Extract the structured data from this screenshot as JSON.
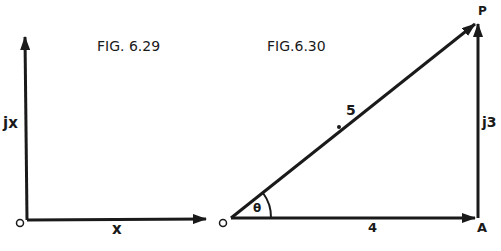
{
  "figures": [
    {
      "title": "FIG. 6.29",
      "origin_label": "O",
      "horizontal_label": "x",
      "vertical_label": "jx"
    },
    {
      "title": "FIG.6.30",
      "origin_label": "O",
      "end_label": "A",
      "apex_label": "P",
      "hypotenuse_label": "5",
      "vertical_label": "j3",
      "horizontal_label": "4",
      "angle_label": "θ"
    }
  ],
  "colors": {
    "ink": "#1a1a1a",
    "background": "#ffffff"
  }
}
